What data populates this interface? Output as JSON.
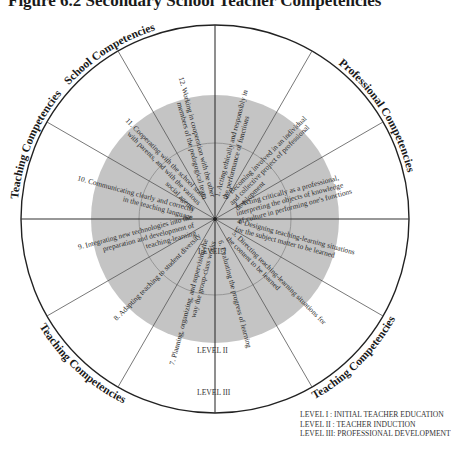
{
  "figure": {
    "title": "Figure 6.2 Secondary School Teacher Competencies"
  },
  "wheel": {
    "center": [
      215,
      219
    ],
    "radius_outer": 194,
    "radius_level2": 124,
    "radius_level1": 76,
    "colors": {
      "fill_inner": "#c4c4c4",
      "stroke": "#555555",
      "outer_stroke": "#222222",
      "background": "#ffffff"
    },
    "rim_labels": [
      {
        "label": "School Competencies",
        "start_deg": -60,
        "end_deg": -5
      },
      {
        "label": "Professional Competencies",
        "start_deg": 15,
        "end_deg": 100
      },
      {
        "label": "Teaching Competencies",
        "start_deg": 100,
        "end_deg": 170
      },
      {
        "label": "Teaching Competencies",
        "start_deg": 190,
        "end_deg": 255
      },
      {
        "label": "Teaching Competencies",
        "start_deg": 265,
        "end_deg": 320
      }
    ],
    "competencies": [
      {
        "num": "1.",
        "lines": [
          "1. Acting ethically and responsibly in",
          "the performance of functions"
        ]
      },
      {
        "num": "2.",
        "lines": [
          "2. Becoming involved in an individual",
          "and collective project of professional",
          "development"
        ]
      },
      {
        "num": "3.",
        "lines": [
          "3. Acting critically as a professional,",
          "interpreting the objects of knowledge",
          "of culture in performing one's functions"
        ]
      },
      {
        "num": "4.",
        "lines": [
          "4. Designing teaching-learning situations",
          "for the subject matter to be learned"
        ]
      },
      {
        "num": "5.",
        "lines": [
          "5. Directing teaching-learning situations for",
          "the content to be learned"
        ]
      },
      {
        "num": "6.",
        "lines": [
          "6. Evaluating the progress of learning"
        ]
      },
      {
        "num": "7.",
        "lines": [
          "7. Planning, organizing, and supervising the",
          "way the group-class works"
        ]
      },
      {
        "num": "8.",
        "lines": [
          "8. Adapting teaching to student diversity"
        ]
      },
      {
        "num": "9.",
        "lines": [
          "9. Integrating  new technologies into the",
          "preparation and development of",
          "teaching-learning"
        ]
      },
      {
        "num": "10.",
        "lines": [
          "10. Communicating clearly and correctly",
          "in the teaching language"
        ]
      },
      {
        "num": "11.",
        "lines": [
          "11. Cooperating with the school staff,",
          "with parents, and with the various",
          "social agents"
        ]
      },
      {
        "num": "12.",
        "lines": [
          "12. Working in cooperation with the other",
          "members of the pedagogical team"
        ]
      }
    ],
    "levels": {
      "level1": "LEVEL I",
      "level2": "LEVEL II",
      "level3": "LEVEL III"
    }
  },
  "legend": {
    "items": [
      "LEVEL I  : INITIAL TEACHER EDUCATION",
      "LEVEL II : TEACHER INDUCTION",
      "LEVEL III: PROFESSIONAL DEVELOPMENT"
    ]
  },
  "source": {
    "text": "Source: Ministère de l'Éducation du Québec, 2001"
  }
}
